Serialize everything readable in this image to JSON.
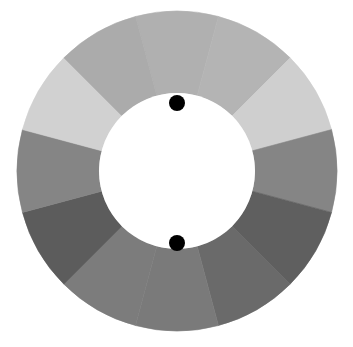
{
  "diagram": {
    "type": "segmented-ring",
    "center": {
      "x": 177,
      "y": 171
    },
    "outer_radius": 160,
    "inner_radius": 78,
    "segment_count": 12,
    "start_angle_deg": -15,
    "segments": [
      {
        "index": 0,
        "position": "top",
        "color": "#b0b0b0"
      },
      {
        "index": 1,
        "position": "top-right-1",
        "color": "#b4b4b4"
      },
      {
        "index": 2,
        "position": "top-right-2",
        "color": "#cfcfcf"
      },
      {
        "index": 3,
        "position": "right",
        "color": "#858585"
      },
      {
        "index": 4,
        "position": "bottom-right-1",
        "color": "#5f5f5f"
      },
      {
        "index": 5,
        "position": "bottom-right-2",
        "color": "#6a6a6a"
      },
      {
        "index": 6,
        "position": "bottom",
        "color": "#7a7a7a"
      },
      {
        "index": 7,
        "position": "bottom-left-1",
        "color": "#7c7c7c"
      },
      {
        "index": 8,
        "position": "bottom-left-2",
        "color": "#5c5c5c"
      },
      {
        "index": 9,
        "position": "left",
        "color": "#858585"
      },
      {
        "index": 10,
        "position": "top-left-1",
        "color": "#d1d1d1"
      },
      {
        "index": 11,
        "position": "top-left-2",
        "color": "#ababab"
      }
    ],
    "markers": [
      {
        "name": "top-dot",
        "x": 177,
        "y": 103,
        "r": 8,
        "color": "#000000"
      },
      {
        "name": "bottom-dot",
        "x": 177,
        "y": 243,
        "r": 8,
        "color": "#000000"
      }
    ],
    "hole_color": "#ffffff"
  }
}
